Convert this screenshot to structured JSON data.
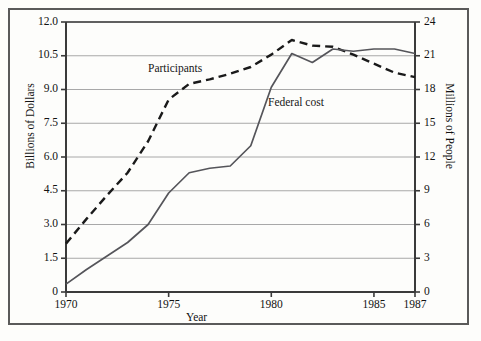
{
  "chart_data": {
    "type": "line",
    "title": "",
    "xlabel": "Year",
    "ylabel": "Billions of Dollars",
    "ylabel_right": "Millions of People",
    "xlim": [
      1970,
      1987
    ],
    "ylim": [
      0,
      12.0
    ],
    "ylim_right": [
      0,
      24
    ],
    "grid": true,
    "legend_position": "inline-annotations",
    "x_ticks": [
      "1970",
      "1975",
      "1980",
      "1985",
      "1987"
    ],
    "x_tick_values": [
      1970,
      1975,
      1980,
      1985,
      1987
    ],
    "y_ticks_left": [
      "0",
      "1.5",
      "3.0",
      "4.5",
      "6.0",
      "7.5",
      "9.0",
      "10.5",
      "12.0"
    ],
    "y_tick_values_left": [
      0,
      1.5,
      3.0,
      4.5,
      6.0,
      7.5,
      9.0,
      10.5,
      12.0
    ],
    "y_ticks_right": [
      "0",
      "3",
      "6",
      "9",
      "12",
      "15",
      "18",
      "21",
      "24"
    ],
    "y_tick_values_right": [
      0,
      3,
      6,
      9,
      12,
      15,
      18,
      21,
      24
    ],
    "x": [
      1970,
      1971,
      1972,
      1973,
      1974,
      1975,
      1976,
      1977,
      1978,
      1979,
      1980,
      1981,
      1982,
      1983,
      1984,
      1985,
      1986,
      1987
    ],
    "series": [
      {
        "name": "Participants",
        "label": "Participants",
        "axis": "right",
        "unit": "Millions of People",
        "style": "dashed",
        "color": "#1a1a1a",
        "values": [
          4.3,
          6.5,
          8.6,
          10.6,
          13.4,
          17.1,
          18.5,
          18.9,
          19.4,
          20.0,
          21.1,
          22.4,
          21.9,
          21.8,
          21.1,
          20.3,
          19.5,
          19.1
        ]
      },
      {
        "name": "Federal cost",
        "label": "Federal cost",
        "axis": "left",
        "unit": "Billions of Dollars",
        "style": "solid",
        "color": "#55555a",
        "values": [
          0.35,
          1.0,
          1.6,
          2.2,
          3.0,
          4.4,
          5.3,
          5.5,
          5.6,
          6.5,
          9.1,
          10.6,
          10.2,
          10.8,
          10.7,
          10.8,
          10.8,
          10.6
        ]
      }
    ],
    "annotations": [
      {
        "text": "Participants",
        "x": 1976.2,
        "y_right": 21.0
      },
      {
        "text": "Federal cost",
        "x": 1981.0,
        "y_left": 7.0
      }
    ]
  },
  "axes": {
    "left_title": "Billions of Dollars",
    "right_title": "Millions of People",
    "x_title": "Year"
  },
  "colors": {
    "frame": "#5a5a5a",
    "grid": "#a8a8a8",
    "axis": "#3a3a3a",
    "participants": "#1a1a1a",
    "federal_cost": "#55555a",
    "background": "#fdfdfb"
  }
}
